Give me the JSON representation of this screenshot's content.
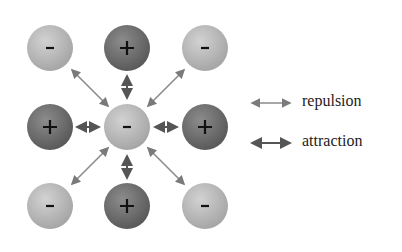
{
  "diagram": {
    "ions": [
      {
        "row": 0,
        "col": 0,
        "charge": "-"
      },
      {
        "row": 0,
        "col": 1,
        "charge": "+"
      },
      {
        "row": 0,
        "col": 2,
        "charge": "-"
      },
      {
        "row": 1,
        "col": 0,
        "charge": "+"
      },
      {
        "row": 1,
        "col": 1,
        "charge": "-"
      },
      {
        "row": 1,
        "col": 2,
        "charge": "+"
      },
      {
        "row": 2,
        "col": 0,
        "charge": "-"
      },
      {
        "row": 2,
        "col": 1,
        "charge": "+"
      },
      {
        "row": 2,
        "col": 2,
        "charge": "-"
      }
    ],
    "colors": {
      "negative": "#b8b8b8",
      "positive": "#6f6f6f",
      "repulsion_arrow": "#8a8a8a",
      "attraction_arrow": "#555555"
    }
  },
  "legend": {
    "repulsion": "repulsion",
    "attraction": "attraction"
  }
}
